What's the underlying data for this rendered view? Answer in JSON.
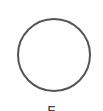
{
  "option": {
    "shape": "circle",
    "state": "unselected",
    "label": "E",
    "colors": {
      "outline": "#555555",
      "fill": "#ffffff",
      "label": "#444444"
    }
  }
}
